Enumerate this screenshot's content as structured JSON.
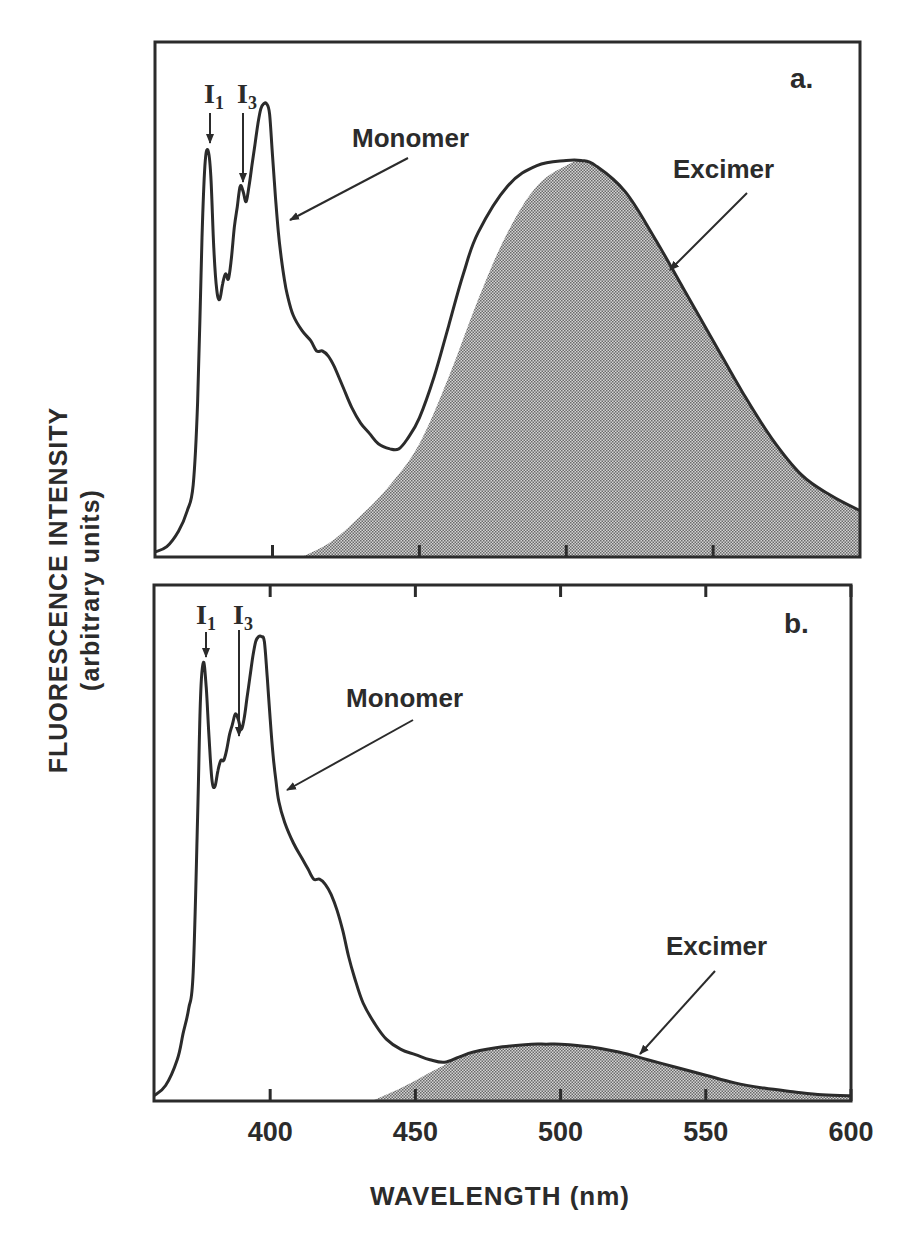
{
  "chart_data": [
    {
      "panel": "a.",
      "type": "line",
      "title": "",
      "xlabel": "WAVELENGTH (nm)",
      "ylabel": "FLUORESCENCE INTENSITY (arbitrary units)",
      "xlim": [
        360,
        600
      ],
      "ylim": [
        0,
        100
      ],
      "xticks": [
        400,
        450,
        500,
        550
      ],
      "grid": false,
      "series": [
        {
          "name": "Monomer",
          "x": [
            360,
            364,
            368,
            371,
            373,
            374.5,
            376,
            377,
            378,
            379,
            380,
            381,
            382,
            383,
            384,
            385,
            386,
            387,
            388,
            389,
            390,
            391,
            392,
            393,
            394,
            395,
            396,
            397,
            398,
            399,
            400,
            401,
            402,
            403,
            404,
            405,
            407,
            410,
            413,
            415,
            417,
            419,
            421,
            424,
            427,
            430,
            433,
            436,
            440,
            443,
            446,
            450,
            455,
            460,
            465,
            470,
            480,
            490,
            500,
            505,
            510,
            520,
            530,
            540,
            550,
            560,
            570,
            580,
            590,
            600
          ],
          "y": [
            1,
            2,
            5,
            9,
            14,
            30,
            62,
            76,
            79,
            74,
            60,
            52,
            50,
            53,
            55,
            54,
            58,
            64,
            68,
            72,
            71,
            69,
            72,
            76,
            80,
            84,
            87,
            88,
            88,
            86,
            78,
            70,
            63,
            58,
            54,
            51,
            47,
            44,
            42,
            40,
            40,
            39,
            37,
            33,
            29,
            26,
            24,
            22,
            21,
            21,
            23,
            27,
            35,
            45,
            55,
            63,
            72,
            76,
            77,
            77,
            76,
            71,
            62,
            52,
            42,
            32,
            23,
            16,
            12,
            9
          ]
        },
        {
          "name": "Excimer",
          "shaded": true,
          "x": [
            410,
            420,
            430,
            440,
            450,
            460,
            470,
            480,
            490,
            500,
            505,
            510,
            520,
            530,
            540,
            550,
            560,
            570,
            580,
            590,
            600
          ],
          "y": [
            0,
            3,
            8,
            14,
            22,
            35,
            50,
            63,
            72,
            76,
            77,
            76,
            71,
            62,
            52,
            42,
            32,
            23,
            16,
            12,
            9
          ]
        }
      ],
      "annotations": [
        "I1",
        "I3",
        "Monomer",
        "Excimer",
        "a."
      ]
    },
    {
      "panel": "b.",
      "type": "line",
      "title": "",
      "xlabel": "WAVELENGTH (nm)",
      "ylabel": "FLUORESCENCE INTENSITY (arbitrary units)",
      "xlim": [
        360,
        600
      ],
      "ylim": [
        0,
        100
      ],
      "xticks": [
        400,
        450,
        500,
        550,
        600
      ],
      "grid": false,
      "series": [
        {
          "name": "Monomer",
          "x": [
            360,
            364,
            368,
            370,
            372,
            373.5,
            375,
            376,
            377,
            378,
            379,
            380,
            381,
            382,
            383,
            384,
            385,
            386,
            387,
            388,
            389,
            390,
            391,
            392,
            393,
            394,
            395,
            396,
            397,
            398,
            399,
            400,
            401,
            402,
            403,
            405,
            408,
            411,
            413,
            415,
            417,
            419,
            421,
            423,
            425,
            427,
            429,
            432,
            436,
            440,
            445,
            450,
            455,
            460,
            465,
            470,
            480,
            490,
            495,
            500,
            510,
            520,
            530,
            540,
            550,
            560,
            570,
            580,
            590,
            600
          ],
          "y": [
            1,
            3,
            8,
            13,
            18,
            25,
            55,
            78,
            85,
            80,
            70,
            62,
            61,
            64,
            66,
            66,
            68,
            71,
            73,
            75,
            74,
            72,
            74,
            78,
            82,
            86,
            89,
            90,
            90,
            89,
            82,
            74,
            67,
            62,
            58,
            54,
            50,
            47,
            45,
            43,
            43,
            42,
            40,
            37,
            33,
            28,
            24,
            19,
            15,
            12,
            10,
            9,
            8,
            7.5,
            8.5,
            9.5,
            10.5,
            11,
            11,
            11,
            10.5,
            9.5,
            8,
            6.5,
            5,
            3.5,
            2.5,
            1.8,
            1.2,
            1
          ]
        },
        {
          "name": "Excimer",
          "shaded": true,
          "x": [
            435,
            445,
            455,
            460,
            465,
            470,
            480,
            490,
            495,
            500,
            510,
            520,
            530,
            540,
            550,
            560,
            570,
            580,
            590,
            600
          ],
          "y": [
            0,
            2.5,
            5.5,
            7,
            8.5,
            9.5,
            10.5,
            11,
            11,
            11,
            10.5,
            9.5,
            8,
            6.5,
            5,
            3.5,
            2.5,
            1.8,
            1.2,
            1
          ]
        }
      ],
      "annotations": [
        "I1",
        "I3",
        "Monomer",
        "Excimer",
        "b."
      ]
    }
  ],
  "figure": {
    "ylabel_line1": "FLUORESCENCE INTENSITY",
    "ylabel_line2": "(arbitrary units)",
    "xlabel": "WAVELENGTH (nm)",
    "xtick_labels": [
      "400",
      "450",
      "500",
      "550",
      "600"
    ],
    "panel_a": {
      "label": "a.",
      "i1": "I",
      "i1_sub": "1",
      "i3": "I",
      "i3_sub": "3",
      "monomer": "Monomer",
      "excimer": "Excimer"
    },
    "panel_b": {
      "label": "b.",
      "i1": "I",
      "i1_sub": "1",
      "i3": "I",
      "i3_sub": "3",
      "monomer": "Monomer",
      "excimer": "Excimer"
    },
    "colors": {
      "line": "#2b2b2b",
      "fill": "#a8a8a8",
      "background": "#ffffff"
    }
  }
}
